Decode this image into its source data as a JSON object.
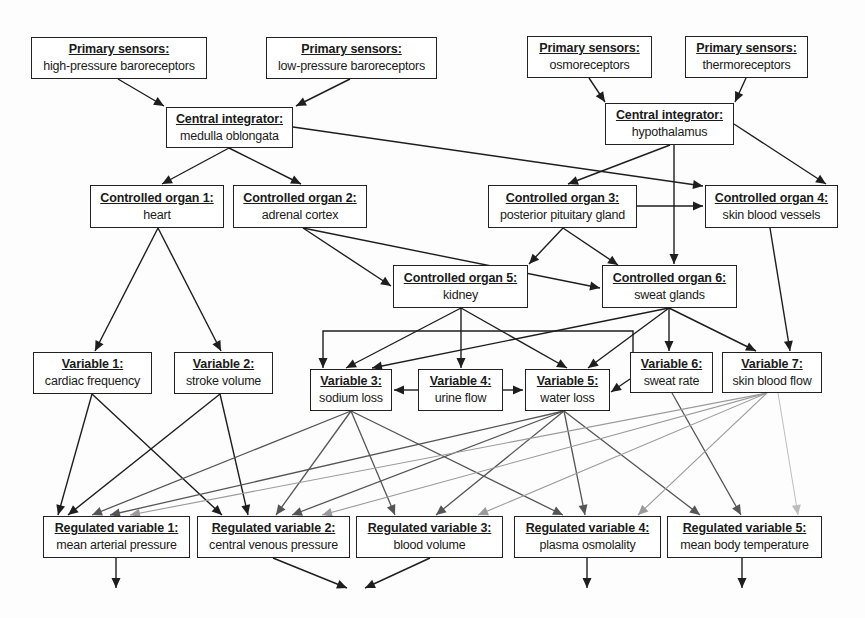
{
  "diagram": {
    "type": "flow-diagram",
    "colors": {
      "edge_dark": "#1e1e1e",
      "edge_mid": "#555555",
      "edge_light": "#9a9a9a",
      "edge_faint": "#bdbdbd",
      "box_border": "#222222"
    },
    "nodes": {
      "ps_hp": {
        "title": "Primary sensors:",
        "sub": "high-pressure baroreceptors",
        "box": [
          31,
          37,
          176,
          42
        ]
      },
      "ps_lp": {
        "title": "Primary sensors:",
        "sub": "low-pressure baroreceptors",
        "box": [
          266,
          37,
          171,
          42
        ]
      },
      "ps_osmo": {
        "title": "Primary sensors:",
        "sub": "osmoreceptors",
        "box": [
          527,
          36,
          125,
          42
        ]
      },
      "ps_thermo": {
        "title": "Primary sensors:",
        "sub": "thermoreceptors",
        "box": [
          685,
          36,
          123,
          42
        ]
      },
      "ci_medulla": {
        "title": "Central integrator:",
        "sub": "medulla oblongata",
        "box": [
          166,
          107,
          127,
          41
        ]
      },
      "ci_hypo": {
        "title": "Central integrator:",
        "sub": "hypothalamus",
        "box": [
          605,
          103,
          129,
          42
        ]
      },
      "co1": {
        "title": "Controlled organ 1:",
        "sub": "heart",
        "box": [
          90,
          185,
          134,
          43
        ]
      },
      "co2": {
        "title": "Controlled organ 2:",
        "sub": "adrenal cortex",
        "box": [
          233,
          185,
          134,
          43
        ]
      },
      "co3": {
        "title": "Controlled organ 3:",
        "sub": "posterior pituitary gland",
        "box": [
          488,
          185,
          149,
          43
        ]
      },
      "co4": {
        "title": "Controlled organ 4:",
        "sub": "skin blood vessels",
        "box": [
          705,
          185,
          133,
          43
        ]
      },
      "co5": {
        "title": "Controlled organ 5:",
        "sub": "kidney",
        "box": [
          393,
          265,
          135,
          43
        ]
      },
      "co6": {
        "title": "Controlled organ 6:",
        "sub": "sweat glands",
        "box": [
          602,
          265,
          135,
          43
        ]
      },
      "v1": {
        "title": "Variable 1:",
        "sub": "cardiac frequency",
        "box": [
          33,
          352,
          119,
          42
        ]
      },
      "v2": {
        "title": "Variable 2:",
        "sub": "stroke volume",
        "box": [
          174,
          352,
          99,
          42
        ]
      },
      "v3": {
        "title": "Variable 3:",
        "sub": "sodium loss",
        "box": [
          310,
          369,
          82,
          42
        ]
      },
      "v4": {
        "title": "Variable 4:",
        "sub": "urine flow",
        "box": [
          418,
          369,
          85,
          42
        ]
      },
      "v5": {
        "title": "Variable 5:",
        "sub": "water loss",
        "box": [
          525,
          369,
          85,
          42
        ]
      },
      "v6": {
        "title": "Variable 6:",
        "sub": "sweat rate",
        "box": [
          630,
          352,
          83,
          41
        ]
      },
      "v7": {
        "title": "Variable 7:",
        "sub": "skin blood flow",
        "box": [
          722,
          352,
          100,
          41
        ]
      },
      "rv1": {
        "title": "Regulated variable 1:",
        "sub": "mean arterial pressure",
        "box": [
          43,
          516,
          147,
          42
        ]
      },
      "rv2": {
        "title": "Regulated variable 2:",
        "sub": "central venous pressure",
        "box": [
          197,
          516,
          153,
          42
        ]
      },
      "rv3": {
        "title": "Regulated variable 3:",
        "sub": "blood volume",
        "box": [
          356,
          516,
          147,
          42
        ]
      },
      "rv4": {
        "title": "Regulated variable 4:",
        "sub": "plasma osmolality",
        "box": [
          514,
          516,
          147,
          42
        ]
      },
      "rv5": {
        "title": "Regulated variable 5:",
        "sub": "mean body temperature",
        "box": [
          667,
          516,
          155,
          42
        ]
      }
    },
    "edges": [
      {
        "from": "ps_hp",
        "to": "ci_medulla",
        "shade": "dark",
        "pts": [
          [
            118,
            79
          ],
          [
            164,
            106
          ]
        ]
      },
      {
        "from": "ps_lp",
        "to": "ci_medulla",
        "shade": "dark",
        "pts": [
          [
            350,
            79
          ],
          [
            296,
            106
          ]
        ]
      },
      {
        "from": "ps_osmo",
        "to": "ci_hypo",
        "shade": "dark",
        "pts": [
          [
            589,
            78
          ],
          [
            605,
            102
          ]
        ]
      },
      {
        "from": "ps_thermo",
        "to": "ci_hypo",
        "shade": "dark",
        "pts": [
          [
            746,
            78
          ],
          [
            735,
            102
          ]
        ]
      },
      {
        "from": "ci_medulla",
        "to": "co1",
        "shade": "dark",
        "pts": [
          [
            229,
            148
          ],
          [
            162,
            184
          ]
        ]
      },
      {
        "from": "ci_medulla",
        "to": "co2",
        "shade": "dark",
        "pts": [
          [
            229,
            148
          ],
          [
            301,
            184
          ]
        ]
      },
      {
        "from": "ci_medulla",
        "to": "co4",
        "shade": "dark",
        "pts": [
          [
            293,
            127
          ],
          [
            703,
            186
          ]
        ]
      },
      {
        "from": "ci_hypo",
        "to": "co3",
        "shade": "dark",
        "pts": [
          [
            670,
            145
          ],
          [
            568,
            184
          ]
        ]
      },
      {
        "from": "ci_hypo",
        "to": "co4",
        "shade": "dark",
        "pts": [
          [
            734,
            124
          ],
          [
            826,
            184
          ]
        ]
      },
      {
        "from": "ci_hypo",
        "to": "co6",
        "shade": "dark",
        "pts": [
          [
            674,
            145
          ],
          [
            674,
            264
          ]
        ]
      },
      {
        "from": "co3",
        "to": "co4",
        "shade": "dark",
        "pts": [
          [
            637,
            206
          ],
          [
            703,
            206
          ]
        ]
      },
      {
        "from": "co1",
        "to": "v1",
        "shade": "dark",
        "pts": [
          [
            158,
            228
          ],
          [
            95,
            351
          ]
        ]
      },
      {
        "from": "co1",
        "to": "v2",
        "shade": "dark",
        "pts": [
          [
            158,
            228
          ],
          [
            221,
            351
          ]
        ]
      },
      {
        "from": "co2",
        "to": "co5",
        "shade": "dark",
        "pts": [
          [
            303,
            228
          ],
          [
            391,
            286
          ]
        ]
      },
      {
        "from": "co2",
        "to": "co6",
        "shade": "dark",
        "pts": [
          [
            303,
            228
          ],
          [
            600,
            288
          ]
        ]
      },
      {
        "from": "co3",
        "to": "co5",
        "shade": "dark",
        "pts": [
          [
            563,
            228
          ],
          [
            529,
            264
          ]
        ]
      },
      {
        "from": "co3",
        "to": "co6",
        "shade": "dark",
        "pts": [
          [
            563,
            228
          ],
          [
            618,
            265
          ]
        ]
      },
      {
        "from": "co4",
        "to": "v7",
        "shade": "dark",
        "pts": [
          [
            770,
            228
          ],
          [
            790,
            351
          ]
        ]
      },
      {
        "from": "co5",
        "to": "v3",
        "shade": "dark",
        "pts": [
          [
            461,
            308
          ],
          [
            346,
            368
          ]
        ]
      },
      {
        "from": "co5",
        "to": "v4",
        "shade": "dark",
        "pts": [
          [
            461,
            308
          ],
          [
            461,
            368
          ]
        ]
      },
      {
        "from": "co5",
        "to": "v5",
        "shade": "dark",
        "pts": [
          [
            461,
            308
          ],
          [
            567,
            368
          ]
        ]
      },
      {
        "from": "co6",
        "to": "v3",
        "shade": "dark",
        "pts": [
          [
            669,
            308
          ],
          [
            372,
            368
          ]
        ]
      },
      {
        "from": "co6",
        "to": "v5",
        "shade": "dark",
        "pts": [
          [
            669,
            308
          ],
          [
            588,
            368
          ]
        ]
      },
      {
        "from": "co6",
        "to": "v6",
        "shade": "dark",
        "pts": [
          [
            669,
            308
          ],
          [
            669,
            351
          ]
        ]
      },
      {
        "from": "co6",
        "to": "v7",
        "shade": "dark",
        "pts": [
          [
            669,
            308
          ],
          [
            756,
            351
          ]
        ]
      },
      {
        "from": "v6",
        "to": "v3",
        "shade": "dark",
        "pts": [
          [
            633,
            352
          ],
          [
            633,
            331
          ],
          [
            323,
            331
          ],
          [
            323,
            368
          ]
        ]
      },
      {
        "from": "v6",
        "to": "v5",
        "shade": "dark",
        "pts": [
          [
            630,
            379
          ],
          [
            611,
            392
          ]
        ]
      },
      {
        "from": "v4",
        "to": "v3",
        "shade": "dark",
        "pts": [
          [
            418,
            390
          ],
          [
            394,
            390
          ]
        ]
      },
      {
        "from": "v4",
        "to": "v5",
        "shade": "dark",
        "pts": [
          [
            503,
            390
          ],
          [
            523,
            390
          ]
        ]
      },
      {
        "from": "v1",
        "to": "rv1",
        "shade": "dark",
        "pts": [
          [
            92,
            394
          ],
          [
            58,
            515
          ]
        ]
      },
      {
        "from": "v1",
        "to": "rv2",
        "shade": "dark",
        "pts": [
          [
            92,
            394
          ],
          [
            222,
            515
          ]
        ]
      },
      {
        "from": "v2",
        "to": "rv1",
        "shade": "dark",
        "pts": [
          [
            220,
            394
          ],
          [
            68,
            515
          ]
        ]
      },
      {
        "from": "v2",
        "to": "rv2",
        "shade": "dark",
        "pts": [
          [
            220,
            394
          ],
          [
            248,
            515
          ]
        ]
      },
      {
        "from": "v3",
        "to": "rv1",
        "shade": "mid",
        "pts": [
          [
            351,
            411
          ],
          [
            92,
            515
          ]
        ]
      },
      {
        "from": "v3",
        "to": "rv2",
        "shade": "mid",
        "pts": [
          [
            351,
            411
          ],
          [
            276,
            515
          ]
        ]
      },
      {
        "from": "v3",
        "to": "rv3",
        "shade": "mid",
        "pts": [
          [
            351,
            411
          ],
          [
            395,
            515
          ]
        ]
      },
      {
        "from": "v3",
        "to": "rv4",
        "shade": "mid",
        "pts": [
          [
            351,
            411
          ],
          [
            563,
            515
          ]
        ]
      },
      {
        "from": "v5",
        "to": "rv1",
        "shade": "mid",
        "pts": [
          [
            564,
            411
          ],
          [
            110,
            515
          ]
        ]
      },
      {
        "from": "v5",
        "to": "rv2",
        "shade": "mid",
        "pts": [
          [
            564,
            411
          ],
          [
            292,
            515
          ]
        ]
      },
      {
        "from": "v5",
        "to": "rv3",
        "shade": "mid",
        "pts": [
          [
            564,
            411
          ],
          [
            436,
            515
          ]
        ]
      },
      {
        "from": "v5",
        "to": "rv4",
        "shade": "mid",
        "pts": [
          [
            564,
            411
          ],
          [
            585,
            515
          ]
        ]
      },
      {
        "from": "v5",
        "to": "rv5",
        "shade": "mid",
        "pts": [
          [
            564,
            411
          ],
          [
            700,
            515
          ]
        ]
      },
      {
        "from": "v6",
        "to": "rv5",
        "shade": "mid",
        "pts": [
          [
            672,
            393
          ],
          [
            741,
            515
          ]
        ]
      },
      {
        "from": "v7",
        "to": "rv1",
        "shade": "light",
        "pts": [
          [
            767,
            393
          ],
          [
            130,
            515
          ]
        ]
      },
      {
        "from": "v7",
        "to": "rv2",
        "shade": "light",
        "pts": [
          [
            767,
            393
          ],
          [
            322,
            515
          ]
        ]
      },
      {
        "from": "v7",
        "to": "rv3",
        "shade": "light",
        "pts": [
          [
            767,
            393
          ],
          [
            478,
            515
          ]
        ]
      },
      {
        "from": "v7",
        "to": "rv4",
        "shade": "light",
        "pts": [
          [
            767,
            393
          ],
          [
            638,
            515
          ]
        ]
      },
      {
        "from": "v7",
        "to": "rv5",
        "shade": "faint",
        "pts": [
          [
            778,
            393
          ],
          [
            798,
            515
          ]
        ]
      },
      {
        "from": "rv1",
        "to": "out",
        "shade": "dark",
        "pts": [
          [
            116,
            558
          ],
          [
            116,
            588
          ]
        ]
      },
      {
        "from": "rv2",
        "to": "out",
        "shade": "dark",
        "pts": [
          [
            273,
            558
          ],
          [
            347,
            588
          ]
        ]
      },
      {
        "from": "rv3",
        "to": "out",
        "shade": "dark",
        "pts": [
          [
            430,
            558
          ],
          [
            365,
            588
          ]
        ]
      },
      {
        "from": "rv4",
        "to": "out",
        "shade": "dark",
        "pts": [
          [
            587,
            558
          ],
          [
            587,
            588
          ]
        ]
      },
      {
        "from": "rv5",
        "to": "out",
        "shade": "dark",
        "pts": [
          [
            742,
            558
          ],
          [
            742,
            588
          ]
        ]
      }
    ]
  }
}
